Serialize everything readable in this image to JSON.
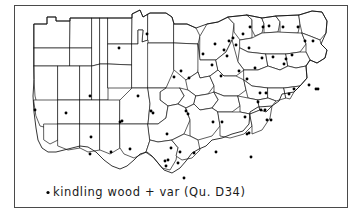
{
  "figure": {
    "kind": "dialect-distribution-map",
    "width": 364,
    "height": 224,
    "background_color": "#ffffff",
    "frame": {
      "x": 14,
      "y": 5,
      "width": 333,
      "height": 202,
      "stroke_color": "#4a4a4a"
    }
  },
  "caption": {
    "bullet": "•",
    "text": "kindling wood + var  (Qu. D34)",
    "keyword": "kindling wood",
    "variant_marker": "+ var",
    "question_reference": "(Qu. D34)",
    "question_code": "D34",
    "x": 46,
    "y": 196,
    "color": "#1a1a1a"
  },
  "legend": {
    "symbol_name": "filled-dot",
    "symbol_color": "#000000",
    "symbol_meaning": "kindling wood + var"
  },
  "map": {
    "title": "",
    "region_outline_color": "#1a1a1a",
    "region_fill_color": "#ffffff",
    "dot_color": "#000000",
    "dot_radius": 1.45,
    "region_count": 58,
    "dot_count": 72,
    "outer_outline": "M 34 66 L 34 24 L 47 24 L 47 17 L 56 17 L 56 21 L 70 21 L 70 18 L 132 18 L 132 14 L 140 10 L 143 17 L 150 13 L 166 13 L 172 17 L 174 24 L 187 24 L 196 28 L 207 24 L 218 22 L 228 17 L 247 15 L 262 18 L 276 16 L 299 15 L 312 11 L 322 12 L 327 21 L 326 33 L 321 44 L 327 50 L 325 58 L 317 63 L 310 60 L 306 66 L 307 78 L 300 86 L 294 92 L 282 94 L 279 101 L 272 106 L 258 107 L 250 112 L 249 124 L 243 131 L 232 134 L 222 138 L 212 140 L 206 146 L 199 149 L 192 153 L 186 161 L 180 168 L 172 173 L 164 170 L 158 163 L 152 156 L 147 152 L 140 154 L 134 160 L 127 166 L 120 169 L 112 166 L 104 160 L 96 152 L 88 147 L 80 146 L 72 148 L 64 150 L 56 152 L 48 152 L 42 148 L 38 140 L 36 128 L 34 112 L 33 96 L 34 80 Z",
    "regions": [
      {
        "id": "r01",
        "d": "M 34 24 L 47 24 L 47 17 L 56 17 L 56 21 L 70 21 L 70 48 L 34 48 Z"
      },
      {
        "id": "r02",
        "d": "M 70 21 L 70 18 L 92 18 L 92 48 L 70 48 Z"
      },
      {
        "id": "r03",
        "d": "M 34 48 L 70 48 L 70 66 L 34 66 Z"
      },
      {
        "id": "r04",
        "d": "M 70 48 L 92 48 L 92 66 L 70 66 Z"
      },
      {
        "id": "r05",
        "d": "M 92 18 L 100 18 L 100 64 L 92 66 Z"
      },
      {
        "id": "r06",
        "d": "M 100 18 L 108 18 L 108 64 L 100 64 Z"
      },
      {
        "id": "r07",
        "d": "M 108 18 L 132 18 L 132 44 L 108 44 Z"
      },
      {
        "id": "r08",
        "d": "M 108 44 L 132 44 L 132 65 L 108 64 Z"
      },
      {
        "id": "r09",
        "d": "M 132 18 L 132 14 L 140 10 L 143 17 L 148 14 L 148 40 L 142 42 L 143 30 L 138 30 L 138 44 L 132 44 Z"
      },
      {
        "id": "r10",
        "d": "M 148 14 L 150 13 L 166 13 L 172 17 L 174 24 L 174 43 L 148 43 Z"
      },
      {
        "id": "r11",
        "d": "M 174 24 L 187 24 L 196 28 L 200 36 L 198 44 L 174 43 Z"
      },
      {
        "id": "r12",
        "d": "M 34 66 L 58 66 L 58 100 L 52 108 L 44 112 L 38 108 L 35 96 L 34 80 Z"
      },
      {
        "id": "r13",
        "d": "M 58 66 L 80 66 L 80 100 L 58 100 Z"
      },
      {
        "id": "r14",
        "d": "M 80 66 L 92 66 L 92 100 L 80 100 Z"
      },
      {
        "id": "r15",
        "d": "M 92 66 L 100 64 L 100 100 L 92 100 Z"
      },
      {
        "id": "r16",
        "d": "M 100 64 L 108 64 L 108 100 L 100 100 Z"
      },
      {
        "id": "r17",
        "d": "M 108 64 L 132 65 L 132 88 L 108 88 Z"
      },
      {
        "id": "r18",
        "d": "M 132 44 L 138 44 L 138 30 L 143 30 L 142 42 L 148 40 L 148 43 L 152 62 L 148 88 L 132 88 Z"
      },
      {
        "id": "r19",
        "d": "M 148 43 L 174 43 L 174 70 L 166 88 L 148 88 Z"
      },
      {
        "id": "r20",
        "d": "M 174 43 L 198 44 L 200 60 L 198 72 L 186 80 L 174 70 Z"
      },
      {
        "id": "r21",
        "d": "M 200 36 L 207 24 L 218 22 L 228 17 L 234 24 L 232 40 L 226 52 L 216 60 L 206 60 L 200 60 Z"
      },
      {
        "id": "r22",
        "d": "M 228 17 L 247 15 L 252 20 L 252 38 L 240 40 L 234 32 L 234 24 Z"
      },
      {
        "id": "r23",
        "d": "M 247 15 L 262 18 L 264 24 L 262 33 L 255 36 L 252 30 L 252 20 Z"
      },
      {
        "id": "r24",
        "d": "M 262 18 L 276 16 L 280 22 L 278 32 L 264 33 L 264 24 Z"
      },
      {
        "id": "r25",
        "d": "M 276 16 L 299 15 L 300 24 L 298 33 L 280 33 L 280 22 Z"
      },
      {
        "id": "r26",
        "d": "M 299 15 L 312 11 L 322 12 L 327 21 L 326 33 L 320 40 L 310 36 L 302 33 L 300 24 Z"
      },
      {
        "id": "r27",
        "d": "M 240 40 L 252 38 L 262 33 L 278 32 L 298 33 L 302 33 L 306 44 L 300 52 L 286 54 L 266 54 L 248 52 L 240 48 Z"
      },
      {
        "id": "r28",
        "d": "M 302 33 L 310 36 L 320 40 L 321 44 L 327 50 L 325 58 L 317 63 L 310 60 L 306 52 L 306 44 Z"
      },
      {
        "id": "r29",
        "d": "M 240 48 L 248 52 L 266 54 L 268 66 L 258 70 L 244 70 L 238 62 Z"
      },
      {
        "id": "r30",
        "d": "M 266 54 L 286 54 L 288 66 L 280 70 L 268 66 Z"
      },
      {
        "id": "r31",
        "d": "M 286 54 L 300 52 L 306 52 L 310 60 L 306 66 L 296 68 L 288 66 Z"
      },
      {
        "id": "r32",
        "d": "M 198 44 L 200 60 L 206 60 L 216 60 L 218 70 L 210 76 L 200 78 L 198 72 Z"
      },
      {
        "id": "r33",
        "d": "M 216 60 L 226 52 L 232 40 L 238 62 L 244 70 L 236 76 L 224 76 L 218 70 Z"
      },
      {
        "id": "r34",
        "d": "M 244 70 L 258 70 L 268 66 L 280 70 L 288 66 L 296 68 L 306 66 L 307 78 L 300 86 L 284 88 L 268 88 L 252 86 L 244 80 Z"
      },
      {
        "id": "r35",
        "d": "M 186 80 L 198 72 L 200 78 L 210 76 L 214 86 L 208 94 L 196 96 L 188 90 Z"
      },
      {
        "id": "r36",
        "d": "M 210 76 L 218 70 L 224 76 L 236 76 L 244 80 L 246 90 L 238 96 L 224 96 L 214 92 L 214 86 Z"
      },
      {
        "id": "r37",
        "d": "M 244 80 L 252 86 L 268 88 L 268 98 L 258 100 L 248 98 L 246 90 Z"
      },
      {
        "id": "r38",
        "d": "M 268 88 L 284 88 L 286 98 L 276 101 L 268 98 Z"
      },
      {
        "id": "r39",
        "d": "M 284 88 L 300 86 L 294 92 L 290 99 L 286 98 Z"
      },
      {
        "id": "r40",
        "d": "M 166 88 L 180 88 L 184 96 L 178 104 L 168 106 L 160 100 L 160 92 Z"
      },
      {
        "id": "r41",
        "d": "M 180 88 L 188 90 L 196 96 L 194 104 L 186 108 L 178 104 L 184 96 Z"
      },
      {
        "id": "r42",
        "d": "M 196 96 L 208 94 L 214 92 L 218 100 L 212 108 L 200 110 L 194 104 Z"
      },
      {
        "id": "r43",
        "d": "M 214 92 L 224 96 L 238 96 L 240 106 L 232 112 L 218 112 L 212 108 L 218 100 Z"
      },
      {
        "id": "r44",
        "d": "M 238 96 L 248 98 L 258 100 L 260 110 L 250 114 L 240 112 L 240 106 Z"
      },
      {
        "id": "r45",
        "d": "M 258 100 L 268 98 L 276 101 L 272 106 L 266 112 L 260 110 Z"
      },
      {
        "id": "r46",
        "d": "M 34 100 L 58 100 L 58 124 L 48 128 L 40 126 L 36 116 Z"
      },
      {
        "id": "r47",
        "d": "M 58 100 L 80 100 L 80 124 L 58 124 Z"
      },
      {
        "id": "r48",
        "d": "M 80 100 L 100 100 L 100 124 L 80 124 Z"
      },
      {
        "id": "r49",
        "d": "M 100 100 L 120 100 L 120 124 L 100 124 Z"
      },
      {
        "id": "r50",
        "d": "M 120 100 L 132 88 L 148 88 L 150 104 L 148 124 L 120 124 Z"
      },
      {
        "id": "r51",
        "d": "M 148 88 L 166 88 L 160 92 L 160 100 L 168 106 L 166 118 L 158 124 L 148 124 L 150 104 Z"
      },
      {
        "id": "r52",
        "d": "M 44 124 L 58 124 L 58 140 L 50 144 L 44 140 Z"
      },
      {
        "id": "r53",
        "d": "M 58 124 L 80 124 L 80 148 L 68 150 L 58 146 Z"
      },
      {
        "id": "r54",
        "d": "M 80 124 L 100 124 L 100 150 L 88 152 L 80 148 Z"
      },
      {
        "id": "r55",
        "d": "M 100 124 L 120 124 L 120 148 L 110 154 L 100 150 Z"
      },
      {
        "id": "r56",
        "d": "M 120 124 L 148 124 L 150 140 L 146 152 L 134 158 L 124 154 L 120 148 Z"
      },
      {
        "id": "r57",
        "d": "M 148 124 L 158 124 L 166 118 L 168 106 L 178 104 L 186 108 L 190 120 L 184 134 L 172 140 L 158 142 L 150 140 Z"
      },
      {
        "id": "r58",
        "d": "M 186 108 L 194 104 L 200 110 L 212 108 L 218 112 L 220 126 L 212 136 L 198 140 L 190 136 L 190 120 Z"
      },
      {
        "id": "r59",
        "d": "M 218 112 L 232 112 L 240 112 L 250 114 L 252 126 L 244 134 L 230 138 L 220 136 L 220 126 Z"
      },
      {
        "id": "r60",
        "d": "M 250 114 L 260 110 L 266 112 L 272 106 L 270 118 L 262 130 L 252 134 L 252 126 Z"
      },
      {
        "id": "r61",
        "d": "M 146 152 L 150 140 L 158 142 L 172 140 L 178 148 L 176 160 L 170 170 L 162 168 L 154 158 Z"
      },
      {
        "id": "r62",
        "d": "M 172 140 L 184 134 L 190 136 L 198 140 L 200 150 L 192 158 L 182 160 L 176 156 L 178 148 Z"
      }
    ],
    "dots": [
      {
        "x": 119,
        "y": 48
      },
      {
        "x": 147,
        "y": 34
      },
      {
        "x": 174,
        "y": 77
      },
      {
        "x": 181,
        "y": 71
      },
      {
        "x": 189,
        "y": 78
      },
      {
        "x": 203,
        "y": 54
      },
      {
        "x": 212,
        "y": 65
      },
      {
        "x": 215,
        "y": 44
      },
      {
        "x": 221,
        "y": 76
      },
      {
        "x": 224,
        "y": 50
      },
      {
        "x": 227,
        "y": 56
      },
      {
        "x": 229,
        "y": 41
      },
      {
        "x": 233,
        "y": 38
      },
      {
        "x": 236,
        "y": 45
      },
      {
        "x": 239,
        "y": 71
      },
      {
        "x": 243,
        "y": 34
      },
      {
        "x": 247,
        "y": 79
      },
      {
        "x": 249,
        "y": 48
      },
      {
        "x": 250,
        "y": 27
      },
      {
        "x": 255,
        "y": 68
      },
      {
        "x": 258,
        "y": 102
      },
      {
        "x": 260,
        "y": 93
      },
      {
        "x": 261,
        "y": 110
      },
      {
        "x": 262,
        "y": 58
      },
      {
        "x": 263,
        "y": 27
      },
      {
        "x": 265,
        "y": 110
      },
      {
        "x": 266,
        "y": 93
      },
      {
        "x": 267,
        "y": 120
      },
      {
        "x": 269,
        "y": 26
      },
      {
        "x": 271,
        "y": 120
      },
      {
        "x": 273,
        "y": 57
      },
      {
        "x": 283,
        "y": 27
      },
      {
        "x": 284,
        "y": 64
      },
      {
        "x": 286,
        "y": 59
      },
      {
        "x": 289,
        "y": 94
      },
      {
        "x": 292,
        "y": 55
      },
      {
        "x": 294,
        "y": 89
      },
      {
        "x": 298,
        "y": 27
      },
      {
        "x": 305,
        "y": 41
      },
      {
        "x": 309,
        "y": 85
      },
      {
        "x": 313,
        "y": 41
      },
      {
        "x": 316,
        "y": 89
      },
      {
        "x": 318,
        "y": 89
      },
      {
        "x": 35,
        "y": 110
      },
      {
        "x": 90,
        "y": 96
      },
      {
        "x": 66,
        "y": 113
      },
      {
        "x": 122,
        "y": 121
      },
      {
        "x": 91,
        "y": 137
      },
      {
        "x": 120,
        "y": 122
      },
      {
        "x": 167,
        "y": 134
      },
      {
        "x": 186,
        "y": 111
      },
      {
        "x": 188,
        "y": 114
      },
      {
        "x": 213,
        "y": 122
      },
      {
        "x": 222,
        "y": 122
      },
      {
        "x": 245,
        "y": 117
      },
      {
        "x": 247,
        "y": 134
      },
      {
        "x": 249,
        "y": 133
      },
      {
        "x": 90,
        "y": 154
      },
      {
        "x": 111,
        "y": 152
      },
      {
        "x": 130,
        "y": 149
      },
      {
        "x": 171,
        "y": 148
      },
      {
        "x": 180,
        "y": 152
      },
      {
        "x": 194,
        "y": 153
      },
      {
        "x": 216,
        "y": 152
      },
      {
        "x": 251,
        "y": 157
      },
      {
        "x": 165,
        "y": 161
      },
      {
        "x": 168,
        "y": 160
      },
      {
        "x": 166,
        "y": 166
      },
      {
        "x": 178,
        "y": 163
      },
      {
        "x": 184,
        "y": 178
      },
      {
        "x": 151,
        "y": 111
      },
      {
        "x": 153,
        "y": 113
      },
      {
        "x": 138,
        "y": 96
      }
    ]
  }
}
